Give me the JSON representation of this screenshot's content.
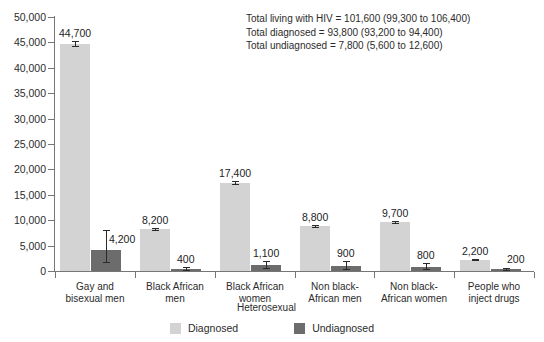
{
  "chart_data": {
    "type": "bar",
    "title": "",
    "subtitle": "",
    "xlabel": "",
    "ylabel": "",
    "ylim": [
      0,
      50000
    ],
    "ytick_step": 5000,
    "grid": false,
    "legend_position": "bottom",
    "categories": [
      "Gay and\nbisexual men",
      "Black African\nmen",
      "Black African\nwomen",
      "Non black-\nAfrican men",
      "Non black-\nAfrican women",
      "People who\ninject drugs"
    ],
    "ytick_labels": [
      "0",
      "5,000",
      "10,000",
      "15,000",
      "20,000",
      "25,000",
      "30,000",
      "35,000",
      "40,000",
      "45,000",
      "50,000"
    ],
    "ytick_values": [
      0,
      5000,
      10000,
      15000,
      20000,
      25000,
      30000,
      35000,
      40000,
      45000,
      50000
    ],
    "series": [
      {
        "name": "Diagnosed",
        "color": "#d3d3d3",
        "values": [
          44700,
          8200,
          17400,
          8800,
          9700,
          2200
        ],
        "labels": [
          "44,700",
          "8,200",
          "17,400",
          "8,800",
          "9,700",
          "2,200"
        ],
        "error_low": [
          44200,
          8000,
          17100,
          8600,
          9500,
          2100
        ],
        "error_high": [
          45200,
          8400,
          17700,
          9000,
          9900,
          2300
        ]
      },
      {
        "name": "Undiagnosed",
        "color": "#6c6c6c",
        "values": [
          4200,
          400,
          1100,
          900,
          800,
          200
        ],
        "labels": [
          "4,200",
          "400",
          "1,100",
          "900",
          "800",
          "200"
        ],
        "error_low": [
          1700,
          200,
          600,
          400,
          400,
          100
        ],
        "error_high": [
          8000,
          800,
          1900,
          2000,
          1500,
          500
        ]
      }
    ],
    "group_bracket_label": "Heterosexual",
    "annotations": [
      "Total living with HIV = 101,600 (99,300 to 106,400)",
      "Total diagnosed = 93,800 (93,200 to 94,400)",
      "Total undiagnosed = 7,800 (5,600 to 12,600)"
    ]
  },
  "legend": {
    "items": [
      {
        "label": "Diagnosed",
        "color": "#d3d3d3"
      },
      {
        "label": "Undiagnosed",
        "color": "#6c6c6c"
      }
    ]
  },
  "colors": {
    "diagnosed": "#d3d3d3",
    "undiagnosed": "#6c6c6c",
    "axis": "#767676",
    "text": "#2b2b2b",
    "background": "#ffffff"
  }
}
